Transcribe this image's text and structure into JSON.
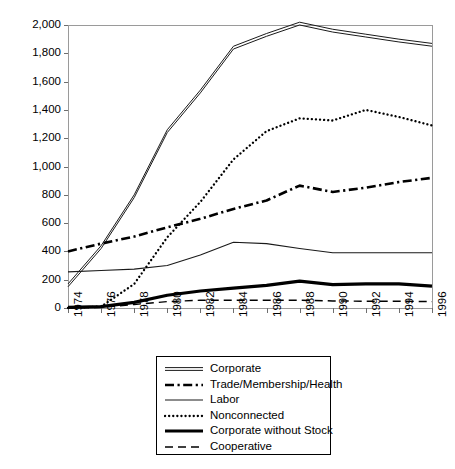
{
  "chart_data": {
    "type": "line",
    "title": "",
    "subtitle": "",
    "xlabel": "",
    "ylabel": "",
    "xlim": [
      1974,
      1996
    ],
    "ylim": [
      0,
      2000
    ],
    "grid": false,
    "legend_position": "below-center",
    "x": [
      1974,
      1976,
      1978,
      1980,
      1982,
      1984,
      1986,
      1988,
      1990,
      1992,
      1994,
      1996
    ],
    "xtick_labels": [
      "1974",
      "1976",
      "1978",
      "1980",
      "1982",
      "1984",
      "1986",
      "1988",
      "1990",
      "1992",
      "1994",
      "1996"
    ],
    "ytick_values": [
      0,
      200,
      400,
      600,
      800,
      1000,
      1200,
      1400,
      1600,
      1800,
      2000
    ],
    "ytick_labels": [
      "0",
      "200",
      "400",
      "600",
      "800",
      "1,000",
      "1,200",
      "1,400",
      "1,600",
      "1,800",
      "2,000"
    ],
    "series": [
      {
        "name": "Corporate",
        "style": "double-solid",
        "color": "#1a1a1a",
        "values": [
          160,
          430,
          790,
          1250,
          1530,
          1840,
          1930,
          2010,
          1960,
          1925,
          1890,
          1860
        ]
      },
      {
        "name": "Trade/Membership/Health",
        "style": "dash-dot",
        "color": "#000000",
        "values": [
          400,
          455,
          505,
          570,
          630,
          700,
          760,
          865,
          820,
          850,
          890,
          920
        ]
      },
      {
        "name": "Labor",
        "style": "thin-solid",
        "color": "#1a1a1a",
        "values": [
          255,
          265,
          275,
          300,
          375,
          465,
          455,
          420,
          390,
          390,
          390,
          390
        ]
      },
      {
        "name": "Nonconnected",
        "style": "dotted",
        "color": "#000000",
        "values": [
          0,
          10,
          170,
          500,
          750,
          1050,
          1250,
          1340,
          1325,
          1400,
          1350,
          1290
        ]
      },
      {
        "name": "Corporate without Stock",
        "style": "thick-solid",
        "color": "#000000",
        "values": [
          5,
          10,
          40,
          90,
          120,
          140,
          160,
          190,
          165,
          170,
          170,
          155
        ]
      },
      {
        "name": "Cooperative",
        "style": "dashed",
        "color": "#000000",
        "values": [
          0,
          5,
          25,
          45,
          55,
          55,
          55,
          55,
          50,
          48,
          48,
          45
        ]
      }
    ]
  },
  "legend": {
    "items": [
      {
        "label": "Corporate",
        "swatch": "double-solid-swatch"
      },
      {
        "label": "Trade/Membership/Health",
        "swatch": "dash-dot-swatch"
      },
      {
        "label": "Labor",
        "swatch": "thin-solid-swatch"
      },
      {
        "label": "Nonconnected",
        "swatch": "dotted-swatch"
      },
      {
        "label": "Corporate without Stock",
        "swatch": "thick-solid-swatch"
      },
      {
        "label": "Cooperative",
        "swatch": "dashed-swatch"
      }
    ]
  },
  "axes": {
    "frame_color": "#9a9a9a",
    "tick_color": "#6e6e6e"
  }
}
